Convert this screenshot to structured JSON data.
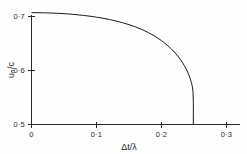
{
  "figure": {
    "background_color": "#fefefe",
    "line_color": "#1a1a1a",
    "text_color": "#2b2b2b"
  },
  "chart_data": {
    "type": "line",
    "title": "",
    "subtitle": "",
    "xlabel": "Δt/λ",
    "ylabel": "uₙ/c",
    "xlim": [
      0,
      0.3
    ],
    "ylim": [
      0.5,
      0.7
    ],
    "grid": false,
    "legend": null,
    "x_ticks": [
      0,
      0.1,
      0.2,
      0.3
    ],
    "x_tick_labels": [
      "0",
      "0·1",
      "0·2",
      "0·3"
    ],
    "y_ticks": [
      0.5,
      0.6,
      0.7
    ],
    "y_tick_labels": [
      "0·5",
      "0·6",
      "0·7"
    ],
    "annotations": [],
    "series": [
      {
        "name": "u_n/c",
        "x": [
          0.0,
          0.01,
          0.02,
          0.03,
          0.04,
          0.05,
          0.06,
          0.07,
          0.08,
          0.09,
          0.1,
          0.11,
          0.12,
          0.13,
          0.14,
          0.15,
          0.16,
          0.17,
          0.18,
          0.19,
          0.2,
          0.205,
          0.21,
          0.215,
          0.22,
          0.225,
          0.23,
          0.235,
          0.238,
          0.241,
          0.244,
          0.246,
          0.2475,
          0.2485,
          0.249,
          0.249,
          0.249
        ],
        "y": [
          0.7071,
          0.707,
          0.7068,
          0.7064,
          0.7059,
          0.7052,
          0.7044,
          0.7033,
          0.702,
          0.7005,
          0.6988,
          0.6968,
          0.6944,
          0.6917,
          0.6885,
          0.6849,
          0.6807,
          0.6758,
          0.6701,
          0.6634,
          0.6553,
          0.6507,
          0.6456,
          0.64,
          0.6338,
          0.6268,
          0.6188,
          0.6094,
          0.6028,
          0.5951,
          0.5856,
          0.5777,
          0.57,
          0.56,
          0.54,
          0.52,
          0.5
        ]
      }
    ]
  },
  "axes": {
    "x_axis_name": "x-axis",
    "y_axis_name": "y-axis"
  }
}
